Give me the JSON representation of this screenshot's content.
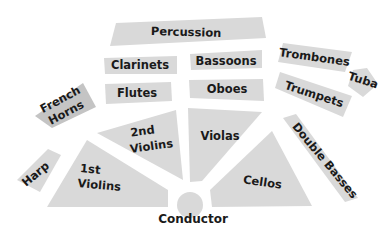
{
  "colors": {
    "section_fill": "#d9d9d9",
    "section_fill_dark": "#c4c4c4",
    "label_text": "#1a1a1a",
    "background": "#ffffff"
  },
  "sections": {
    "percussion": "Percussion",
    "clarinets": "Clarinets",
    "bassoons": "Bassoons",
    "flutes": "Flutes",
    "oboes": "Oboes",
    "trombones": "Trombones",
    "tuba": "Tuba",
    "trumpets": "Trumpets",
    "french_horns_line1": "French",
    "french_horns_line2": "Horns",
    "harp": "Harp",
    "first_violins_line1": "1st",
    "first_violins_line2": "Violins",
    "second_violins_line1": "2nd",
    "second_violins_line2": "Violins",
    "violas": "Violas",
    "cellos": "Cellos",
    "double_basses": "Double Basses",
    "conductor": "Conductor"
  }
}
